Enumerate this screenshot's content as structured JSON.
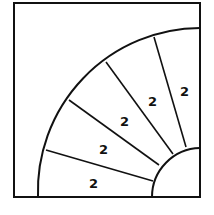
{
  "diagram": {
    "stroke_color": "#111111",
    "sector_labels": [
      "2",
      "2",
      "2",
      "2",
      "2"
    ]
  }
}
